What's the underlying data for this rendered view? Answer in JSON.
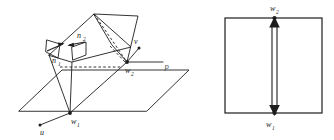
{
  "figure": {
    "background_color": "#ffffff",
    "ink_color": "#1d1d1d",
    "left_panel": {
      "name": "three-dimensional plane intersection diagram",
      "plane_label": "P",
      "labels": {
        "n1": {
          "base": "n",
          "sub": "1"
        },
        "n2": {
          "base": "n",
          "sub": "2"
        },
        "w1": {
          "base": "w",
          "sub": "1"
        },
        "w2": {
          "base": "w",
          "sub": "2"
        },
        "u": {
          "base": "u",
          "sub": ""
        },
        "v": {
          "base": "v",
          "sub": ""
        }
      }
    },
    "right_panel": {
      "name": "rectangle with vertical double-headed arrow",
      "labels": {
        "w2_top": {
          "base": "w",
          "sub": "2"
        },
        "w1_bottom": {
          "base": "w",
          "sub": "1"
        }
      }
    }
  }
}
